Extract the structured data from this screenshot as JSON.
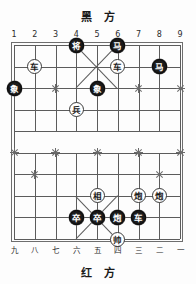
{
  "board": {
    "black_side_label": "黑 方",
    "red_side_label": "红 方",
    "top_coords": [
      "1",
      "2",
      "3",
      "4",
      "5",
      "6",
      "7",
      "8",
      "9"
    ],
    "bottom_coords": [
      "九",
      "八",
      "七",
      "六",
      "五",
      "四",
      "三",
      "二",
      "一"
    ],
    "columns": 9,
    "rows": 10,
    "colors": {
      "line": "#5c5c5c",
      "frame": "#6e6e6e",
      "black_piece_bg": "#1b1b1b",
      "black_piece_fg": "#ffffff",
      "red_piece_bg": "#ffffff",
      "red_piece_fg": "#1b1b1b",
      "background": "#fdfdfd"
    },
    "star_points": [
      {
        "col": 1,
        "row": 3
      },
      {
        "col": 3,
        "row": 3
      },
      {
        "col": 5,
        "row": 3
      },
      {
        "col": 7,
        "row": 3
      },
      {
        "col": 9,
        "row": 3
      },
      {
        "col": 2,
        "row": 2
      },
      {
        "col": 8,
        "row": 2
      },
      {
        "col": 1,
        "row": 6
      },
      {
        "col": 3,
        "row": 6
      },
      {
        "col": 5,
        "row": 6
      },
      {
        "col": 7,
        "row": 6
      },
      {
        "col": 9,
        "row": 6
      },
      {
        "col": 2,
        "row": 7
      },
      {
        "col": 8,
        "row": 7
      }
    ],
    "pieces": [
      {
        "id": "b-general",
        "label": "将",
        "color": "black",
        "col": 4,
        "row": 1
      },
      {
        "id": "b-horse-1",
        "label": "马",
        "color": "black",
        "col": 6,
        "row": 1
      },
      {
        "id": "r-chariot-1",
        "label": "车",
        "color": "red",
        "col": 2,
        "row": 2
      },
      {
        "id": "r-chariot-2",
        "label": "车",
        "color": "red",
        "col": 6,
        "row": 2
      },
      {
        "id": "b-horse-2",
        "label": "马",
        "color": "black",
        "col": 8,
        "row": 2
      },
      {
        "id": "b-elephant-1",
        "label": "象",
        "color": "black",
        "col": 1,
        "row": 3
      },
      {
        "id": "b-elephant-2",
        "label": "象",
        "color": "black",
        "col": 5,
        "row": 3
      },
      {
        "id": "r-pawn-1",
        "label": "兵",
        "color": "red",
        "col": 4,
        "row": 4
      },
      {
        "id": "r-minister",
        "label": "相",
        "color": "red",
        "col": 5,
        "row": 8
      },
      {
        "id": "r-cannon-1",
        "label": "炮",
        "color": "red",
        "col": 7,
        "row": 8
      },
      {
        "id": "r-cannon-2",
        "label": "炮",
        "color": "red",
        "col": 8,
        "row": 8
      },
      {
        "id": "b-soldier-1",
        "label": "卒",
        "color": "black",
        "col": 4,
        "row": 9
      },
      {
        "id": "b-soldier-2",
        "label": "卒",
        "color": "black",
        "col": 5,
        "row": 9
      },
      {
        "id": "b-cannon-1",
        "label": "炮",
        "color": "black",
        "col": 6,
        "row": 9
      },
      {
        "id": "b-chariot-1",
        "label": "车",
        "color": "black",
        "col": 7,
        "row": 9
      },
      {
        "id": "r-general",
        "label": "帅",
        "color": "red",
        "col": 6,
        "row": 10
      }
    ]
  }
}
